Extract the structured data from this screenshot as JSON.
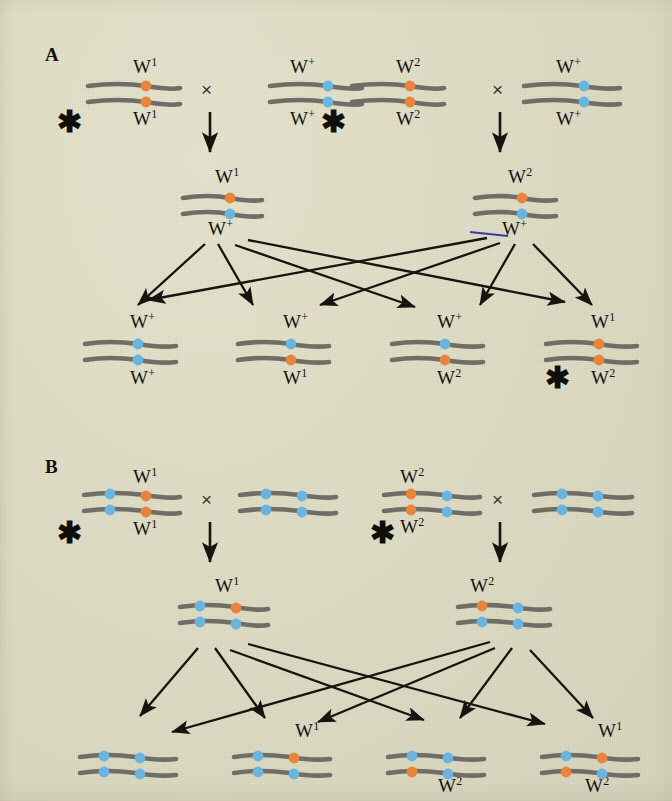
{
  "figure": {
    "background_color": "#e2dfca",
    "chromosome_color": "#6e6e66",
    "mutant_dot_color": "#e8843c",
    "wildtype_dot_color": "#6ab4e0",
    "arrow_color": "#16140f",
    "text_color": "#15130f"
  },
  "panels": [
    {
      "id": "A",
      "letter": "A",
      "parent_cross": {
        "cross_symbol": "×",
        "left_cross": {
          "asterisk": "✱",
          "mother": {
            "top_label": "W",
            "top_sup": "1",
            "bottom_label": "W",
            "bottom_sup": "1",
            "dots": [
              "mutant",
              "mutant"
            ]
          },
          "father": {
            "top_label": "W",
            "top_sup": "+",
            "bottom_label": "W",
            "bottom_sup": "+",
            "dots": [
              "wildtype",
              "wildtype"
            ]
          }
        },
        "right_cross": {
          "asterisk": "✱",
          "mother": {
            "top_label": "W",
            "top_sup": "2",
            "bottom_label": "W",
            "bottom_sup": "2",
            "dots": [
              "mutant",
              "mutant"
            ]
          },
          "father": {
            "top_label": "W",
            "top_sup": "+",
            "bottom_label": "W",
            "bottom_sup": "+",
            "dots": [
              "wildtype",
              "wildtype"
            ]
          }
        }
      },
      "f1": [
        {
          "top_label": "W",
          "top_sup": "1",
          "bottom_label": "W",
          "bottom_sup": "+",
          "dots": [
            "mutant",
            "wildtype"
          ]
        },
        {
          "top_label": "W",
          "top_sup": "2",
          "bottom_label": "W",
          "bottom_sup": "+",
          "dots": [
            "mutant",
            "wildtype"
          ]
        }
      ],
      "f2": [
        {
          "top_label": "W",
          "top_sup": "+",
          "bottom_label": "W",
          "bottom_sup": "+",
          "dots": [
            "wildtype",
            "wildtype"
          ],
          "asterisk": ""
        },
        {
          "top_label": "W",
          "top_sup": "+",
          "bottom_label": "W",
          "bottom_sup": "1",
          "dots": [
            "wildtype",
            "mutant"
          ],
          "asterisk": ""
        },
        {
          "top_label": "W",
          "top_sup": "+",
          "bottom_label": "W",
          "bottom_sup": "2",
          "dots": [
            "wildtype",
            "mutant"
          ],
          "asterisk": ""
        },
        {
          "top_label": "W",
          "top_sup": "1",
          "bottom_label": "W",
          "bottom_sup": "2",
          "dots": [
            "mutant",
            "mutant"
          ],
          "asterisk": "✱"
        }
      ]
    },
    {
      "id": "B",
      "letter": "B",
      "parent_cross": {
        "cross_symbol": "×",
        "left_cross": {
          "asterisk": "✱",
          "mother": {
            "top_label": "W",
            "top_sup": "1",
            "bottom_label": "W",
            "bottom_sup": "1",
            "dots_left": [
              "wildtype",
              "wildtype"
            ],
            "dots_right": [
              "mutant",
              "mutant"
            ]
          },
          "father": {
            "top_label": "",
            "top_sup": "",
            "bottom_label": "",
            "bottom_sup": "",
            "dots_left": [
              "wildtype",
              "wildtype"
            ],
            "dots_right": [
              "wildtype",
              "wildtype"
            ]
          }
        },
        "right_cross": {
          "asterisk": "✱",
          "mother": {
            "top_label": "W",
            "top_sup": "2",
            "bottom_label": "W",
            "bottom_sup": "2",
            "dots_left": [
              "mutant",
              "mutant"
            ],
            "dots_right": [
              "wildtype",
              "wildtype"
            ]
          },
          "father": {
            "top_label": "",
            "top_sup": "",
            "bottom_label": "",
            "bottom_sup": "",
            "dots_left": [
              "wildtype",
              "wildtype"
            ],
            "dots_right": [
              "wildtype",
              "wildtype"
            ]
          }
        }
      },
      "f1": [
        {
          "top_label": "W",
          "top_sup": "1",
          "bottom_label": "",
          "bottom_sup": "",
          "dots_left": [
            "wildtype",
            "wildtype"
          ],
          "dots_right": [
            "mutant",
            "wildtype"
          ]
        },
        {
          "top_label": "W",
          "top_sup": "2",
          "bottom_label": "",
          "bottom_sup": "",
          "dots_left": [
            "mutant",
            "wildtype"
          ],
          "dots_right": [
            "wildtype",
            "wildtype"
          ]
        }
      ],
      "f2": [
        {
          "top_label": "",
          "top_sup": "",
          "bottom_label": "",
          "bottom_sup": "",
          "dots_left": [
            "wildtype",
            "wildtype"
          ],
          "dots_right": [
            "wildtype",
            "wildtype"
          ]
        },
        {
          "top_label": "W",
          "top_sup": "1",
          "bottom_label": "",
          "bottom_sup": "",
          "dots_left": [
            "wildtype",
            "wildtype"
          ],
          "dots_right": [
            "mutant",
            "wildtype"
          ]
        },
        {
          "top_label": "",
          "top_sup": "",
          "bottom_label": "W",
          "bottom_sup": "2",
          "dots_left": [
            "wildtype",
            "mutant"
          ],
          "dots_right": [
            "wildtype",
            "wildtype"
          ]
        },
        {
          "top_label": "W",
          "top_sup": "1",
          "bottom_label": "W",
          "bottom_sup": "2",
          "dots_left": [
            "wildtype",
            "mutant"
          ],
          "dots_right": [
            "mutant",
            "wildtype"
          ]
        }
      ]
    }
  ]
}
